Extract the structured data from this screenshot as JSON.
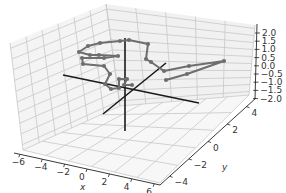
{
  "chart_data": {
    "type": "line3d",
    "title": "",
    "xlabel": "x",
    "ylabel": "y",
    "zlabel": "z",
    "xlim": [
      -6,
      6
    ],
    "ylim": [
      -5,
      5
    ],
    "zlim": [
      -2.2,
      2.2
    ],
    "xticks": [
      "−6",
      "−4",
      "−2",
      "0",
      "2",
      "4",
      "6"
    ],
    "yticks": [
      "−4",
      "−2",
      "0",
      "2",
      "4"
    ],
    "zticks": [
      "2.0",
      "1.5",
      "1.0",
      "0.5",
      "0.0",
      "−0.5",
      "−1.0",
      "−1.5",
      "−2.0"
    ],
    "grid": true,
    "legend": null,
    "series": [
      {
        "name": "trajectory",
        "color": "#6e6e6e",
        "marker": "o",
        "screen_points": [
          [
            166,
            80
          ],
          [
            187,
            74
          ],
          [
            224,
            61
          ],
          [
            189,
            66
          ],
          [
            164,
            71
          ],
          [
            151,
            62
          ],
          [
            146,
            59
          ],
          [
            148,
            44
          ],
          [
            129,
            40
          ],
          [
            120,
            41
          ],
          [
            100,
            43
          ],
          [
            88,
            46
          ],
          [
            79,
            52
          ],
          [
            90,
            55
          ],
          [
            99,
            55
          ],
          [
            118,
            56
          ],
          [
            104,
            58
          ],
          [
            82,
            58
          ],
          [
            83,
            64
          ],
          [
            104,
            66
          ],
          [
            110,
            74
          ],
          [
            105,
            84
          ],
          [
            111,
            89
          ],
          [
            119,
            88
          ],
          [
            119,
            79
          ],
          [
            127,
            79
          ],
          [
            124,
            85
          ],
          [
            132,
            85
          ]
        ]
      }
    ],
    "reference_axes": {
      "color": "#1a1a1a",
      "x_axis_segment": [
        [
          63,
          75
        ],
        [
          199,
          103
        ]
      ],
      "y_axis_segment": [
        [
          103,
          114
        ],
        [
          166,
          63
        ]
      ],
      "z_axis_segment": [
        [
          125,
          38
        ],
        [
          125,
          131
        ]
      ],
      "origin": [
        125,
        88
      ]
    }
  },
  "colors": {
    "pane_line": "#c8c8c8",
    "pane_fill": "#f5f5f5",
    "axis_line": "#222222",
    "data_line": "#6e6e6e",
    "text": "#333333"
  }
}
